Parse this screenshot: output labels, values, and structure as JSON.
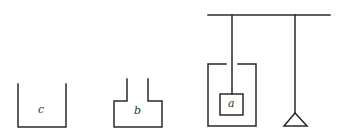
{
  "diagram": {
    "labels": {
      "c": "c",
      "b": "b",
      "a": "a"
    },
    "stroke_color": "#2a2a2a"
  }
}
